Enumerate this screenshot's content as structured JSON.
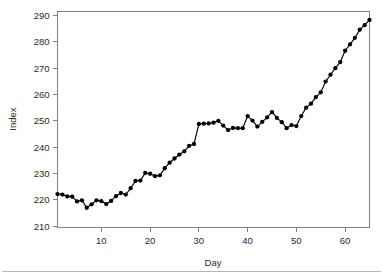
{
  "chart_data": {
    "type": "line",
    "title": "",
    "subtitle": "",
    "xlabel": "Day",
    "ylabel": "Index",
    "xlim": [
      1,
      65
    ],
    "ylim": [
      209.5,
      291.5
    ],
    "xticks": [
      10,
      20,
      30,
      40,
      50,
      60
    ],
    "yticks": [
      210,
      220,
      230,
      240,
      250,
      260,
      270,
      280,
      290
    ],
    "xtick_labels": [
      "10",
      "20",
      "30",
      "40",
      "50",
      "60"
    ],
    "ytick_labels": [
      "210",
      "220",
      "230",
      "240",
      "250",
      "260",
      "270",
      "280",
      "290"
    ],
    "grid": false,
    "legend": false,
    "legend_position": "none",
    "marker": "filled-circle",
    "line_color": "#000000",
    "marker_color": "#000000",
    "axis_color": "#808080",
    "background_color": "#ffffff",
    "x": [
      1,
      2,
      3,
      4,
      5,
      6,
      7,
      8,
      9,
      10,
      11,
      12,
      13,
      14,
      15,
      16,
      17,
      18,
      19,
      20,
      21,
      22,
      23,
      24,
      25,
      26,
      27,
      28,
      29,
      30,
      31,
      32,
      33,
      34,
      35,
      36,
      37,
      38,
      39,
      40,
      41,
      42,
      43,
      44,
      45,
      46,
      47,
      48,
      49,
      50,
      51,
      52,
      53,
      54,
      55,
      56,
      57,
      58,
      59,
      60,
      61,
      62,
      63,
      64,
      65
    ],
    "values": [
      222.2,
      222.0,
      221.3,
      221.2,
      219.4,
      219.8,
      217.0,
      218.3,
      219.8,
      219.5,
      218.4,
      219.6,
      221.4,
      222.6,
      222.0,
      224.4,
      227.2,
      227.3,
      230.2,
      229.9,
      229.0,
      229.3,
      232.0,
      234.1,
      235.7,
      237.2,
      238.4,
      240.5,
      241.2,
      248.8,
      248.9,
      249.0,
      249.3,
      250.0,
      248.2,
      246.5,
      247.3,
      247.2,
      247.2,
      251.8,
      250.1,
      247.8,
      249.6,
      251.3,
      253.3,
      251.1,
      249.5,
      247.2,
      248.4,
      248.0,
      251.8,
      255.0,
      256.5,
      259.0,
      260.8,
      264.9,
      267.5,
      270.0,
      272.3,
      276.6,
      279.0,
      281.5,
      284.6,
      286.3,
      288.3
    ],
    "series": [
      {
        "name": "Index",
        "values": [
          222.2,
          222.0,
          221.3,
          221.2,
          219.4,
          219.8,
          217.0,
          218.3,
          219.8,
          219.5,
          218.4,
          219.6,
          221.4,
          222.6,
          222.0,
          224.4,
          227.2,
          227.3,
          230.2,
          229.9,
          229.0,
          229.3,
          232.0,
          234.1,
          235.7,
          237.2,
          238.4,
          240.5,
          241.2,
          248.8,
          248.9,
          249.0,
          249.3,
          250.0,
          248.2,
          246.5,
          247.3,
          247.2,
          247.2,
          251.8,
          250.1,
          247.8,
          249.6,
          251.3,
          253.3,
          251.1,
          249.5,
          247.2,
          248.4,
          248.0,
          251.8,
          255.0,
          256.5,
          259.0,
          260.8,
          264.9,
          267.5,
          270.0,
          272.3,
          276.6,
          279.0,
          281.5,
          284.6,
          286.3,
          288.3
        ]
      }
    ]
  }
}
